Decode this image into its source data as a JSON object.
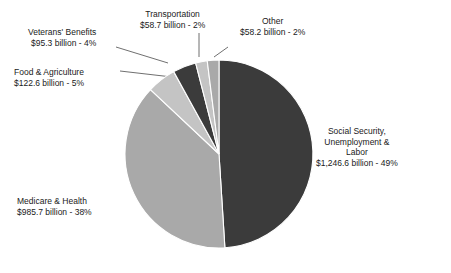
{
  "chart_data": {
    "type": "pie",
    "title": "",
    "subtitle": "",
    "xlabel": "",
    "ylabel": "",
    "legend_position": "callout-labels",
    "grid": false,
    "value_unit": "billion USD",
    "categories": [
      "Social Security, Unemployment & Labor",
      "Medicare & Health",
      "Food & Agriculture",
      "Veterans' Benefits",
      "Transportation",
      "Other"
    ],
    "values": [
      1246.6,
      985.7,
      122.6,
      95.3,
      58.7,
      58.2
    ],
    "percentages": [
      49,
      38,
      5,
      4,
      2,
      2
    ],
    "colors": [
      "#3b3b3b",
      "#a9a9a9",
      "#c4c4c4",
      "#3b3b3b",
      "#c4c4c4",
      "#a9a9a9"
    ],
    "slices": [
      {
        "name": "Social Security, Unemployment & Labor",
        "value": 1246.6,
        "percent": 49,
        "color": "#3b3b3b",
        "start_angle_deg": 0,
        "end_angle_deg": 176.4,
        "label_lines": [
          "Social Security,",
          "Unemployment &",
          "Labor",
          "$1,246.6 billion - 49%"
        ]
      },
      {
        "name": "Medicare & Health",
        "value": 985.7,
        "percent": 38,
        "color": "#a9a9a9",
        "start_angle_deg": 176.4,
        "end_angle_deg": 313.2,
        "label_lines": [
          "Medicare & Health",
          "$985.7 billion - 38%"
        ]
      },
      {
        "name": "Food & Agriculture",
        "value": 122.6,
        "percent": 5,
        "color": "#c4c4c4",
        "start_angle_deg": 313.2,
        "end_angle_deg": 331.2,
        "label_lines": [
          "Food & Agriculture",
          "$122.6 billion - 5%"
        ]
      },
      {
        "name": "Veterans' Benefits",
        "value": 95.3,
        "percent": 4,
        "color": "#3b3b3b",
        "start_angle_deg": 331.2,
        "end_angle_deg": 345.6,
        "label_lines": [
          "Veterans' Benefits",
          "$95.3 billion - 4%"
        ]
      },
      {
        "name": "Transportation",
        "value": 58.7,
        "percent": 2,
        "color": "#c4c4c4",
        "start_angle_deg": 345.6,
        "end_angle_deg": 352.8,
        "label_lines": [
          "Transportation",
          "$58.7 billion - 2%"
        ]
      },
      {
        "name": "Other",
        "value": 58.2,
        "percent": 2,
        "color": "#a9a9a9",
        "start_angle_deg": 352.8,
        "end_angle_deg": 360,
        "label_lines": [
          "Other",
          "$58.2 billion - 2%"
        ]
      }
    ]
  },
  "labels": {
    "social_security": {
      "line1": "Social Security,",
      "line2": "Unemployment &",
      "line3": "Labor",
      "line4": "$1,246.6 billion - 49%"
    },
    "medicare": {
      "line1": "Medicare & Health",
      "line2": "$985.7 billion - 38%"
    },
    "food": {
      "line1": "Food & Agriculture",
      "line2": "$122.6 billion - 5%"
    },
    "veterans": {
      "line1": "Veterans' Benefits",
      "line2": "$95.3 billion - 4%"
    },
    "transportation": {
      "line1": "Transportation",
      "line2": "$58.7 billion - 2%"
    },
    "other": {
      "line1": "Other",
      "line2": "$58.2 billion - 2%"
    }
  }
}
